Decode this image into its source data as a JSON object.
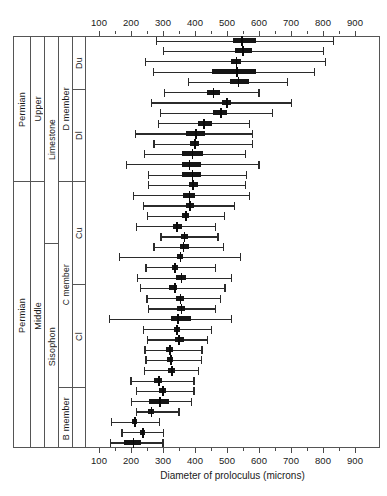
{
  "chart_data": {
    "type": "boxplot",
    "title": "",
    "xlabel": "Diameter of proloculus (microns)",
    "ylabel": "",
    "xlim": [
      0,
      1000
    ],
    "xticks": [
      100,
      200,
      300,
      400,
      500,
      600,
      700,
      800,
      900
    ],
    "xtick_labels": [
      "100",
      "200",
      "300",
      "400",
      "500",
      "600",
      "700",
      "800",
      "900"
    ],
    "axis_duplicated_top_and_bottom": true,
    "grid": false,
    "legend": null,
    "orientation": "horizontal",
    "box_stats_order": [
      "min",
      "q1",
      "median",
      "q3",
      "max"
    ],
    "stratigraphy": {
      "columns": [
        {
          "name": "system",
          "cells": [
            {
              "label": "Permian",
              "start_row": 0,
              "end_row": 13
            },
            {
              "label": "Permian",
              "start_row": 14,
              "end_row": 39
            }
          ]
        },
        {
          "name": "series",
          "cells": [
            {
              "label": "Upper",
              "start_row": 0,
              "end_row": 13
            },
            {
              "label": "Middle",
              "start_row": 14,
              "end_row": 39
            }
          ]
        },
        {
          "name": "formation",
          "cells": [
            {
              "label": "Limestone",
              "start_row": 0,
              "end_row": 19
            },
            {
              "label": "Sisophon",
              "start_row": 20,
              "end_row": 39
            }
          ]
        },
        {
          "name": "member",
          "cells": [
            {
              "label": "D member",
              "start_row": 0,
              "end_row": 13
            },
            {
              "label": "C  member",
              "start_row": 14,
              "end_row": 33
            },
            {
              "label": "B member",
              "start_row": 34,
              "end_row": 39
            }
          ]
        },
        {
          "name": "submember",
          "cells": [
            {
              "label": "Du",
              "start_row": 0,
              "end_row": 4
            },
            {
              "label": "Dl",
              "start_row": 5,
              "end_row": 13
            },
            {
              "label": "Cu",
              "start_row": 14,
              "end_row": 23
            },
            {
              "label": "Cl",
              "start_row": 24,
              "end_row": 33
            },
            {
              "label": "",
              "start_row": 34,
              "end_row": 39
            }
          ]
        }
      ]
    },
    "boxes": [
      {
        "index": 0,
        "min": 278,
        "q1": 520,
        "median": 545,
        "q3": 590,
        "max": 830
      },
      {
        "index": 1,
        "min": 300,
        "q1": 525,
        "median": 548,
        "q3": 578,
        "max": 800
      },
      {
        "index": 2,
        "min": 243,
        "q1": 512,
        "median": 527,
        "q3": 545,
        "max": 805
      },
      {
        "index": 3,
        "min": 268,
        "q1": 452,
        "median": 528,
        "q3": 592,
        "max": 772
      },
      {
        "index": 4,
        "min": 378,
        "q1": 508,
        "median": 533,
        "q3": 570,
        "max": 688
      },
      {
        "index": 5,
        "min": 303,
        "q1": 438,
        "median": 455,
        "q3": 478,
        "max": 598
      },
      {
        "index": 6,
        "min": 262,
        "q1": 485,
        "median": 497,
        "q3": 512,
        "max": 700
      },
      {
        "index": 7,
        "min": 290,
        "q1": 455,
        "median": 478,
        "q3": 500,
        "max": 640
      },
      {
        "index": 8,
        "min": 283,
        "q1": 408,
        "median": 425,
        "q3": 452,
        "max": 568
      },
      {
        "index": 9,
        "min": 212,
        "q1": 372,
        "median": 400,
        "q3": 432,
        "max": 578
      },
      {
        "index": 10,
        "min": 270,
        "q1": 385,
        "median": 398,
        "q3": 412,
        "max": 578
      },
      {
        "index": 11,
        "min": 240,
        "q1": 360,
        "median": 390,
        "q3": 425,
        "max": 555
      },
      {
        "index": 12,
        "min": 185,
        "q1": 358,
        "median": 380,
        "q3": 418,
        "max": 598
      },
      {
        "index": 13,
        "min": 253,
        "q1": 358,
        "median": 390,
        "q3": 420,
        "max": 558
      },
      {
        "index": 14,
        "min": 252,
        "q1": 382,
        "median": 392,
        "q3": 408,
        "max": 555
      },
      {
        "index": 15,
        "min": 205,
        "q1": 362,
        "median": 380,
        "q3": 400,
        "max": 568
      },
      {
        "index": 16,
        "min": 238,
        "q1": 372,
        "median": 382,
        "q3": 398,
        "max": 522
      },
      {
        "index": 17,
        "min": 250,
        "q1": 358,
        "median": 370,
        "q3": 382,
        "max": 490
      },
      {
        "index": 18,
        "min": 215,
        "q1": 330,
        "median": 342,
        "q3": 358,
        "max": 462
      },
      {
        "index": 19,
        "min": 292,
        "q1": 355,
        "median": 365,
        "q3": 378,
        "max": 470
      },
      {
        "index": 20,
        "min": 270,
        "q1": 352,
        "median": 362,
        "q3": 382,
        "max": 488
      },
      {
        "index": 21,
        "min": 163,
        "q1": 345,
        "median": 352,
        "q3": 362,
        "max": 540
      },
      {
        "index": 22,
        "min": 245,
        "q1": 328,
        "median": 335,
        "q3": 348,
        "max": 462
      },
      {
        "index": 23,
        "min": 218,
        "q1": 342,
        "median": 355,
        "q3": 372,
        "max": 512
      },
      {
        "index": 24,
        "min": 228,
        "q1": 320,
        "median": 335,
        "q3": 345,
        "max": 492
      },
      {
        "index": 25,
        "min": 248,
        "q1": 342,
        "median": 352,
        "q3": 365,
        "max": 478
      },
      {
        "index": 26,
        "min": 252,
        "q1": 345,
        "median": 355,
        "q3": 368,
        "max": 462
      },
      {
        "index": 27,
        "min": 130,
        "q1": 325,
        "median": 345,
        "q3": 388,
        "max": 512
      },
      {
        "index": 28,
        "min": 238,
        "q1": 335,
        "median": 342,
        "q3": 352,
        "max": 450
      },
      {
        "index": 29,
        "min": 250,
        "q1": 338,
        "median": 348,
        "q3": 365,
        "max": 438
      },
      {
        "index": 30,
        "min": 242,
        "q1": 310,
        "median": 320,
        "q3": 332,
        "max": 420
      },
      {
        "index": 31,
        "min": 245,
        "q1": 312,
        "median": 322,
        "q3": 332,
        "max": 418
      },
      {
        "index": 32,
        "min": 240,
        "q1": 315,
        "median": 325,
        "q3": 338,
        "max": 408
      },
      {
        "index": 33,
        "min": 198,
        "q1": 272,
        "median": 285,
        "q3": 298,
        "max": 395
      },
      {
        "index": 34,
        "min": 215,
        "q1": 288,
        "median": 298,
        "q3": 310,
        "max": 395
      },
      {
        "index": 35,
        "min": 200,
        "q1": 255,
        "median": 288,
        "q3": 320,
        "max": 388
      },
      {
        "index": 36,
        "min": 215,
        "q1": 252,
        "median": 262,
        "q3": 272,
        "max": 348
      },
      {
        "index": 37,
        "min": 138,
        "q1": 203,
        "median": 210,
        "q3": 218,
        "max": 288
      },
      {
        "index": 38,
        "min": 170,
        "q1": 228,
        "median": 235,
        "q3": 243,
        "max": 300
      },
      {
        "index": 39,
        "min": 135,
        "q1": 178,
        "median": 205,
        "q3": 232,
        "max": 298
      }
    ]
  }
}
